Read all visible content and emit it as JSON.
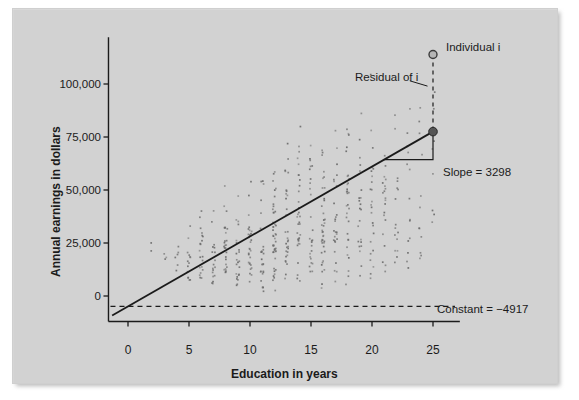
{
  "figure": {
    "background_color": "#d2d2d2",
    "ink_color": "#1b1b1b",
    "point_color": "#6e6e6e"
  },
  "chart_data": {
    "type": "scatter",
    "title": "",
    "xlabel": "Education in years",
    "ylabel": "Annual earnings in dollars",
    "xlim": [
      -1.6,
      27.2
    ],
    "ylim": [
      -12000,
      122000
    ],
    "xticks": [
      0,
      5,
      10,
      15,
      20,
      25
    ],
    "xticklabels": [
      "0",
      "5",
      "10",
      "15",
      "20",
      "25"
    ],
    "yticks": [
      0,
      25000,
      50000,
      75000,
      100000
    ],
    "yticklabels": [
      "0",
      "25,000",
      "50,000",
      "75,000",
      "100,000"
    ],
    "grid": false,
    "legend": "none",
    "regression": {
      "slope": 3298,
      "intercept": -4917,
      "equation": "earnings = -4917 + 3298 * education",
      "x_start": -1.3,
      "x_end": 25.0,
      "y_start": -9204,
      "y_end": 77533
    },
    "constant_line": {
      "style": "dashed",
      "y": -4917,
      "label": "Constant = −4917"
    },
    "highlight": {
      "individual_point": {
        "x": 25.0,
        "y": 113900,
        "label": "Individual i",
        "marker": "open-circle"
      },
      "fitted_point": {
        "x": 25.0,
        "y": 77533,
        "marker": "filled-circle"
      },
      "residual": {
        "label": "Residual of i",
        "style": "dashed-vertical",
        "value": 36367
      }
    },
    "slope_triangle": {
      "label": "Slope = 3298",
      "x_from": 21.0,
      "x_to": 25.0,
      "y_base": 64338,
      "y_top": 77533
    },
    "series": [
      {
        "name": "individuals",
        "note": "one marker per respondent; values cluster in vertical columns at integer years of education",
        "columns": [
          {
            "x": 2,
            "n": 2,
            "y_min": 18000,
            "y_max": 31000
          },
          {
            "x": 3,
            "n": 3,
            "y_min": 11000,
            "y_max": 30000
          },
          {
            "x": 4,
            "n": 6,
            "y_min": 8000,
            "y_max": 36000
          },
          {
            "x": 5,
            "n": 14,
            "y_min": 3000,
            "y_max": 47000
          },
          {
            "x": 6,
            "n": 20,
            "y_min": 2500,
            "y_max": 57000
          },
          {
            "x": 7,
            "n": 18,
            "y_min": 2500,
            "y_max": 52000
          },
          {
            "x": 8,
            "n": 26,
            "y_min": 2000,
            "y_max": 62000
          },
          {
            "x": 9,
            "n": 22,
            "y_min": 2000,
            "y_max": 59000
          },
          {
            "x": 10,
            "n": 28,
            "y_min": 1500,
            "y_max": 65000
          },
          {
            "x": 11,
            "n": 26,
            "y_min": 1500,
            "y_max": 69000
          },
          {
            "x": 12,
            "n": 44,
            "y_min": 1000,
            "y_max": 78000
          },
          {
            "x": 13,
            "n": 30,
            "y_min": 1500,
            "y_max": 80000
          },
          {
            "x": 14,
            "n": 34,
            "y_min": 1500,
            "y_max": 86000
          },
          {
            "x": 15,
            "n": 26,
            "y_min": 2000,
            "y_max": 88000
          },
          {
            "x": 16,
            "n": 38,
            "y_min": 2500,
            "y_max": 99000
          },
          {
            "x": 17,
            "n": 26,
            "y_min": 3000,
            "y_max": 96000
          },
          {
            "x": 18,
            "n": 30,
            "y_min": 3000,
            "y_max": 104000
          },
          {
            "x": 19,
            "n": 22,
            "y_min": 4000,
            "y_max": 100000
          },
          {
            "x": 20,
            "n": 24,
            "y_min": 5000,
            "y_max": 106000
          },
          {
            "x": 21,
            "n": 20,
            "y_min": 7000,
            "y_max": 103000
          },
          {
            "x": 22,
            "n": 16,
            "y_min": 9000,
            "y_max": 108000
          },
          {
            "x": 23,
            "n": 14,
            "y_min": 12000,
            "y_max": 105000
          },
          {
            "x": 24,
            "n": 12,
            "y_min": 16000,
            "y_max": 110000
          },
          {
            "x": 25,
            "n": 8,
            "y_min": 24000,
            "y_max": 112000
          }
        ]
      }
    ]
  }
}
